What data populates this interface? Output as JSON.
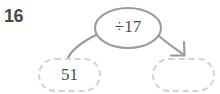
{
  "problem": {
    "number": "16"
  },
  "machine": {
    "operation_label": "÷17",
    "operation_icon": "divide-icon"
  },
  "input": {
    "value": "51",
    "placeholder": ""
  },
  "output": {
    "value": "",
    "placeholder": ""
  },
  "connectors": {
    "input_arrow": "curve-from-input-to-machine",
    "output_arrow": "curve-from-machine-to-output"
  },
  "colors": {
    "line": "#9a9a9a",
    "dashed_border": "#d2d2d2",
    "text": "#4b4b4b",
    "number_text": "#4a4a4a",
    "background": "#ffffff"
  }
}
